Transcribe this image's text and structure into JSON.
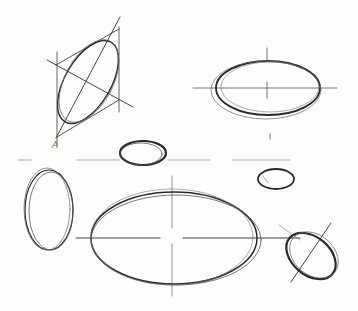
{
  "image": {
    "description": "Pencil sketch study of ellipses with construction axes",
    "paper_color": "#fdfdfc",
    "stroke_color": "#2a2a2a",
    "light_stroke_color": "#6a6a6a"
  },
  "annotations": [
    {
      "text": "A",
      "x": 52,
      "y": 150
    }
  ],
  "sketches": [
    {
      "name": "tilted-ellipse-in-rhombus",
      "cx": 90,
      "cy": 80,
      "rx": 24,
      "ry": 46,
      "rotate": 28
    },
    {
      "name": "horizontal-ellipse-top-right",
      "cx": 268,
      "cy": 88,
      "rx": 52,
      "ry": 28,
      "rotate": 0
    },
    {
      "name": "small-ellipse-center",
      "cx": 143,
      "cy": 153,
      "rx": 23,
      "ry": 12,
      "rotate": 0
    },
    {
      "name": "small-ellipse-right",
      "cx": 276,
      "cy": 178,
      "rx": 18,
      "ry": 10,
      "rotate": 0
    },
    {
      "name": "vertical-ellipse-left",
      "cx": 49,
      "cy": 210,
      "rx": 23,
      "ry": 40,
      "rotate": 0
    },
    {
      "name": "large-ellipse-bottom",
      "cx": 174,
      "cy": 238,
      "rx": 84,
      "ry": 47,
      "rotate": 0
    },
    {
      "name": "tilted-ellipse-bottom-right",
      "cx": 311,
      "cy": 257,
      "rx": 27,
      "ry": 20,
      "rotate": 40
    }
  ]
}
